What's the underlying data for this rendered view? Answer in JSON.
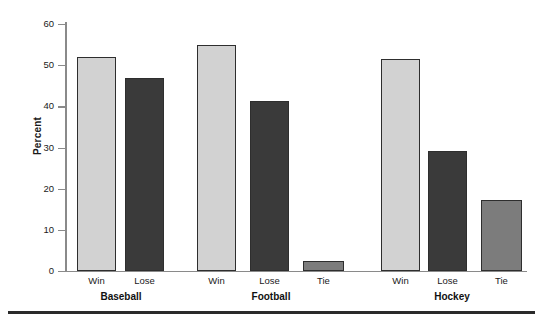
{
  "chart_data": {
    "type": "bar",
    "title": "",
    "xlabel": "",
    "ylabel": "Percent",
    "ylim": [
      0,
      60
    ],
    "ytick_step": 10,
    "yticks": [
      60,
      50,
      40,
      30,
      20,
      10,
      0
    ],
    "grid": false,
    "legend": "none",
    "categories": [
      "Baseball",
      "Football",
      "Hockey"
    ],
    "series": [
      {
        "name": "Win",
        "color": "#d2d2d2"
      },
      {
        "name": "Lose",
        "color": "#3a3a3a"
      },
      {
        "name": "Tie",
        "color": "#7c7c7c"
      }
    ],
    "bars": [
      {
        "group": "Baseball",
        "outcome": "Win",
        "value": 52.0
      },
      {
        "group": "Baseball",
        "outcome": "Lose",
        "value": 47.0
      },
      {
        "group": "Football",
        "outcome": "Win",
        "value": 54.8
      },
      {
        "group": "Football",
        "outcome": "Lose",
        "value": 41.3
      },
      {
        "group": "Football",
        "outcome": "Tie",
        "value": 2.4
      },
      {
        "group": "Hockey",
        "outcome": "Win",
        "value": 51.4
      },
      {
        "group": "Hockey",
        "outcome": "Lose",
        "value": 29.2
      },
      {
        "group": "Hockey",
        "outcome": "Tie",
        "value": 17.3
      }
    ]
  },
  "axis": {
    "y_title": "Percent",
    "tick_labels": [
      "60",
      "50",
      "40",
      "30",
      "20",
      "10",
      "0"
    ]
  },
  "group_labels": [
    "Baseball",
    "Football",
    "Hockey"
  ],
  "bar_labels": [
    "Win",
    "Lose",
    "Win",
    "Lose",
    "Tie",
    "Win",
    "Lose",
    "Tie"
  ],
  "colors": {
    "win_fill": "#d2d2d2",
    "lose_fill": "#3a3a3a",
    "tie_fill": "#7c7c7c",
    "bar_stroke": "#2e2e2e",
    "axis": "#8a8a8a",
    "text": "#1a1a1a",
    "rule": "#2a2a2a"
  }
}
